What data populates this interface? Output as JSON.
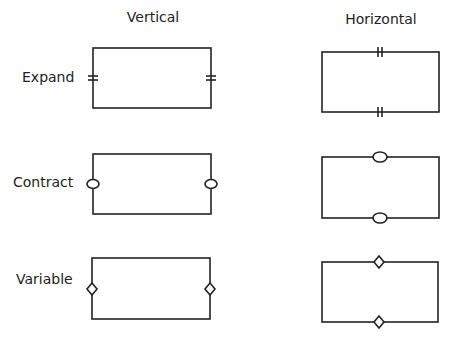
{
  "columns": [
    {
      "label": "Vertical"
    },
    {
      "label": "Horizontal"
    }
  ],
  "rows": [
    {
      "label": "Expand",
      "marker": "double-bar"
    },
    {
      "label": "Contract",
      "marker": "oval"
    },
    {
      "label": "Variable",
      "marker": "diamond"
    }
  ],
  "colors": {
    "stroke": "#222222",
    "background": "#ffffff"
  }
}
